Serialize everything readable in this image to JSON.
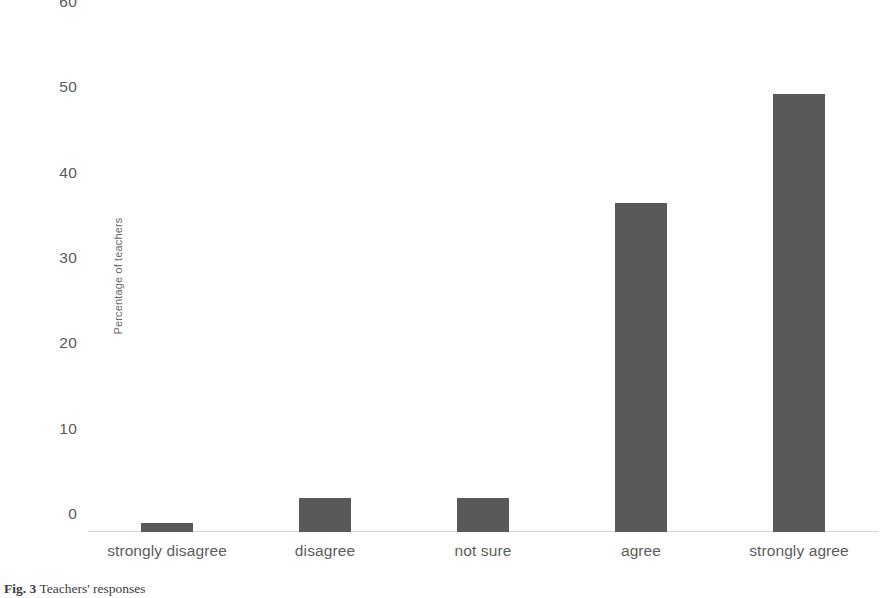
{
  "chart_data": {
    "type": "bar",
    "title": "",
    "subtitle": "",
    "xlabel": "",
    "ylabel": "Percentage of teachers",
    "categories": [
      "strongly disagree",
      "disagree",
      "not sure",
      "agree",
      "strongly agree"
    ],
    "values": [
      1.0,
      4.0,
      4.0,
      38.6,
      51.3
    ],
    "series": [
      {
        "name": "Percentage of teachers",
        "values": [
          1.0,
          4.0,
          4.0,
          38.6,
          51.3
        ]
      }
    ],
    "ylim": [
      0,
      60
    ],
    "yticks": [
      0,
      10,
      20,
      30,
      40,
      50,
      60
    ],
    "ytick_labels": [
      "0",
      "10",
      "20",
      "30",
      "40",
      "50",
      "60"
    ],
    "grid": false,
    "legend": false,
    "legend_position": "none",
    "bar_color": "#595959",
    "axis_color": "#d4d4d4",
    "tick_label_color": "#5a5a5a"
  },
  "caption": {
    "label": "Fig. 3",
    "text": "Teachers' responses"
  }
}
